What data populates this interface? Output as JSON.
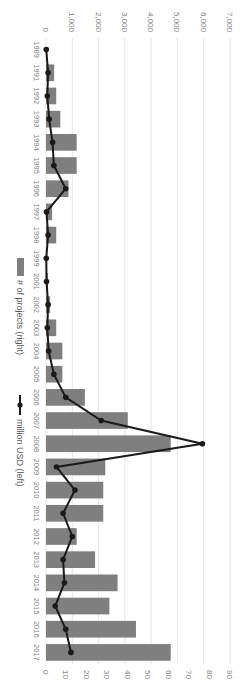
{
  "chart_data": {
    "type": "bar",
    "orientation_note": "figure rotated 90 degrees clockwise",
    "title": "",
    "categories": [
      "1989",
      "1991",
      "1992",
      "1993",
      "1994",
      "1995",
      "1996",
      "1997",
      "1998",
      "1999",
      "2001",
      "2002",
      "2003",
      "2004",
      "2005",
      "2006",
      "2007",
      "2008",
      "2009",
      "2010",
      "2011",
      "2012",
      "2013",
      "2014",
      "2015",
      "2016",
      "2017"
    ],
    "series": [
      {
        "name": "# of projects (right)",
        "type": "bar",
        "axis": "right",
        "color": "#7f7f7f",
        "values": [
          0,
          4,
          5,
          7,
          15,
          15,
          11,
          3,
          5,
          0,
          1,
          2,
          5,
          8,
          8,
          19,
          40,
          61,
          29,
          28,
          28,
          15,
          24,
          35,
          31,
          44,
          61
        ]
      },
      {
        "name": "million USD (left)",
        "type": "line",
        "axis": "left",
        "color": "#1a1a1a",
        "values": [
          10,
          80,
          50,
          120,
          250,
          300,
          750,
          20,
          80,
          10,
          20,
          80,
          50,
          100,
          300,
          750,
          2100,
          5950,
          400,
          1100,
          650,
          1000,
          650,
          700,
          350,
          750,
          950
        ]
      }
    ],
    "left_axis": {
      "label": "",
      "ylim": [
        0,
        7000
      ],
      "ticks": [
        "0",
        "1,000",
        "2,000",
        "3,000",
        "4,000",
        "5,000",
        "6,000",
        "7,000"
      ]
    },
    "right_axis": {
      "label": "",
      "ylim": [
        0,
        90
      ],
      "ticks": [
        "0",
        "10",
        "20",
        "30",
        "40",
        "50",
        "60",
        "70",
        "80",
        "90"
      ]
    },
    "grid": true,
    "legend": {
      "position": "bottom",
      "entries": [
        "# of projects (right)",
        "million USD (left)"
      ]
    }
  },
  "legend": {
    "bars_label": "# of projects (right)",
    "line_label": "million USD (left)"
  }
}
